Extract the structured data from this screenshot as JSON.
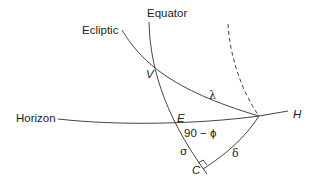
{
  "labels": {
    "equator": "Equator",
    "ecliptic": "Ecliptic",
    "horizon": "Horizon",
    "H": "H",
    "V": "V",
    "E": "E",
    "C": "C",
    "lambda": "λ",
    "colatitude": "90 − ϕ",
    "sigma": "σ",
    "delta": "δ"
  },
  "colors": {
    "line": "#444444",
    "text": "#222222",
    "background": "#ffffff"
  }
}
